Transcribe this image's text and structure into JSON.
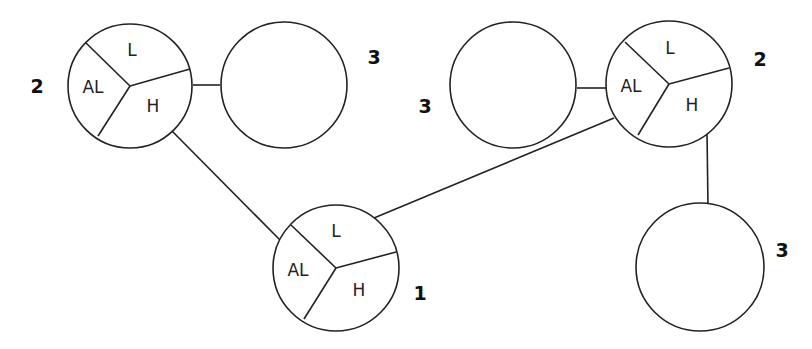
{
  "diagram": {
    "nodes": [
      {
        "id": "n1",
        "type": "divided",
        "order_label": "2",
        "segments": {
          "top": "L",
          "left": "AL",
          "right": "H"
        }
      },
      {
        "id": "n2",
        "type": "empty",
        "order_label": "3"
      },
      {
        "id": "n3",
        "type": "empty",
        "order_label": "3"
      },
      {
        "id": "n4",
        "type": "divided",
        "order_label": "2",
        "segments": {
          "top": "L",
          "left": "AL",
          "right": "H"
        }
      },
      {
        "id": "n5",
        "type": "divided",
        "order_label": "1",
        "segments": {
          "top": "L",
          "left": "AL",
          "right": "H"
        }
      },
      {
        "id": "n6",
        "type": "empty",
        "order_label": "3"
      }
    ],
    "edges": [
      {
        "from": "n1",
        "to": "n2"
      },
      {
        "from": "n1",
        "to": "n5"
      },
      {
        "from": "n3",
        "to": "n4"
      },
      {
        "from": "n4",
        "to": "n5"
      },
      {
        "from": "n4",
        "to": "n6"
      }
    ],
    "colors": {
      "stroke": "#222222",
      "background": "#ffffff"
    }
  }
}
